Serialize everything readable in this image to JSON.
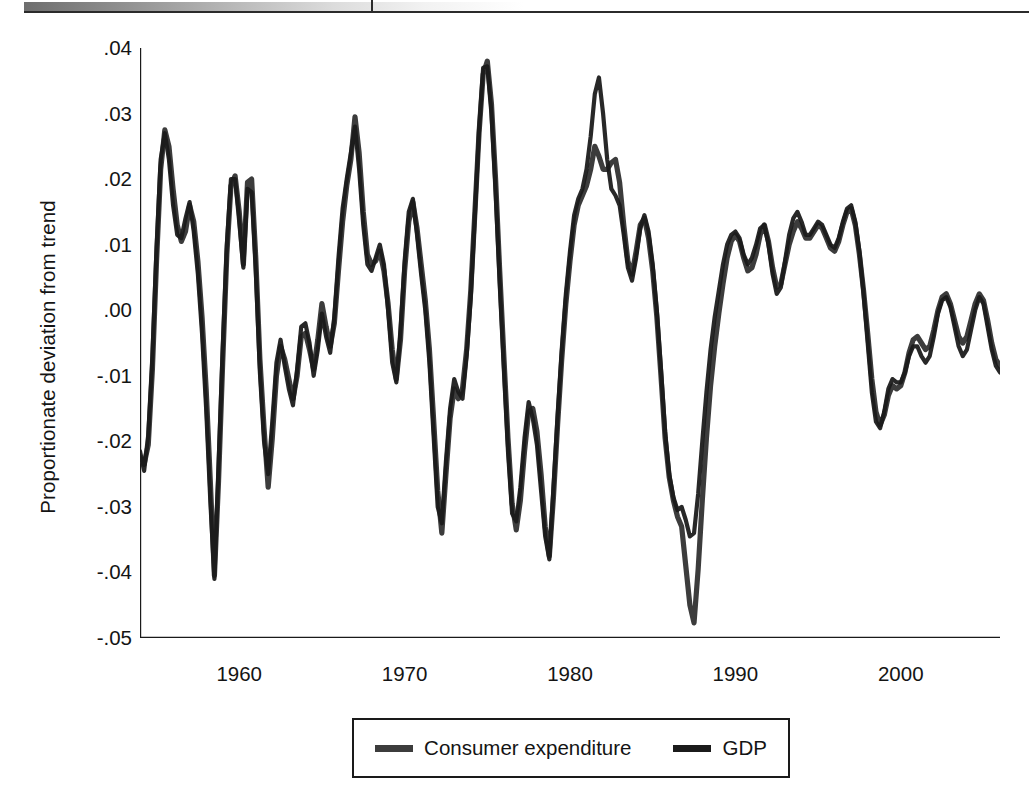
{
  "figure": {
    "title": "",
    "y_axis_title": "Proportionate deviation from trend"
  },
  "legend": {
    "items": [
      {
        "label": "Consumer expenditure",
        "color": "#3c3c3c",
        "swatch": "legend-swatch-consumer-expenditure"
      },
      {
        "label": "GDP",
        "color": "#1b1b1b",
        "swatch": "legend-swatch-gdp"
      }
    ]
  },
  "chart_data": {
    "type": "line",
    "title": "",
    "xlabel": "",
    "ylabel": "Proportionate deviation from trend",
    "xlim": [
      1954.0,
      2006.0
    ],
    "ylim": [
      -0.05,
      0.04
    ],
    "grid": false,
    "legend_position": "bottom-center",
    "y_ticks": [
      0.04,
      0.03,
      0.02,
      0.01,
      0.0,
      -0.01,
      -0.02,
      -0.03,
      -0.04,
      -0.05
    ],
    "y_tick_labels": [
      ".04",
      ".03",
      ".02",
      ".01",
      ".00",
      "-.01",
      "-.02",
      "-.03",
      "-.04",
      "-.05"
    ],
    "x_ticks": [
      1960,
      1970,
      1980,
      1990,
      2000
    ],
    "x_tick_labels": [
      "1960",
      "1970",
      "1980",
      "1990",
      "2000"
    ],
    "x_start": 1954.0,
    "x_step": 0.25,
    "series": [
      {
        "name": "Consumer expenditure",
        "color": "#3c3c3c",
        "values": [
          -0.0225,
          -0.0235,
          -0.0205,
          -0.009,
          0.0075,
          0.0215,
          0.0275,
          0.025,
          0.0185,
          0.013,
          0.0105,
          0.012,
          0.016,
          0.0135,
          0.0075,
          -0.001,
          -0.012,
          -0.026,
          -0.0405,
          -0.026,
          -0.008,
          0.0085,
          0.019,
          0.0205,
          0.015,
          0.007,
          0.0195,
          0.02,
          0.008,
          -0.0075,
          -0.018,
          -0.027,
          -0.0195,
          -0.01,
          -0.0055,
          -0.0075,
          -0.0105,
          -0.0135,
          -0.01,
          -0.004,
          -0.0035,
          -0.006,
          -0.009,
          -0.0045,
          0.001,
          -0.0025,
          -0.0055,
          -0.002,
          0.006,
          0.0135,
          0.019,
          0.023,
          0.0295,
          0.024,
          0.015,
          0.0085,
          0.007,
          0.0075,
          0.009,
          0.006,
          0.001,
          -0.006,
          -0.0105,
          -0.0045,
          0.006,
          0.0135,
          0.0165,
          0.0125,
          0.007,
          0.0015,
          -0.006,
          -0.0165,
          -0.0275,
          -0.034,
          -0.025,
          -0.0165,
          -0.012,
          -0.0135,
          -0.012,
          -0.006,
          0.003,
          0.015,
          0.027,
          0.036,
          0.038,
          0.0315,
          0.02,
          0.006,
          -0.007,
          -0.0195,
          -0.0295,
          -0.0335,
          -0.029,
          -0.0215,
          -0.0155,
          -0.015,
          -0.0185,
          -0.025,
          -0.033,
          -0.0375,
          -0.0285,
          -0.0175,
          -0.0075,
          0.001,
          0.0075,
          0.013,
          0.016,
          0.0175,
          0.019,
          0.0215,
          0.025,
          0.0235,
          0.0215,
          0.0215,
          0.0225,
          0.023,
          0.0195,
          0.013,
          0.0075,
          0.0055,
          0.009,
          0.013,
          0.014,
          0.011,
          0.006,
          -0.001,
          -0.01,
          -0.0195,
          -0.0255,
          -0.029,
          -0.0315,
          -0.033,
          -0.039,
          -0.045,
          -0.0477,
          -0.0395,
          -0.029,
          -0.0195,
          -0.0115,
          -0.0055,
          -0.0005,
          0.004,
          0.008,
          0.0105,
          0.0115,
          0.0105,
          0.008,
          0.006,
          0.0065,
          0.0085,
          0.0115,
          0.013,
          0.0105,
          0.0065,
          0.0035,
          0.004,
          0.007,
          0.01,
          0.012,
          0.0135,
          0.0125,
          0.011,
          0.011,
          0.012,
          0.013,
          0.0125,
          0.011,
          0.0095,
          0.009,
          0.0105,
          0.013,
          0.015,
          0.0155,
          0.013,
          0.0085,
          0.003,
          -0.0035,
          -0.0105,
          -0.0155,
          -0.0175,
          -0.016,
          -0.013,
          -0.0115,
          -0.012,
          -0.0115,
          -0.0095,
          -0.0065,
          -0.0045,
          -0.004,
          -0.005,
          -0.006,
          -0.0055,
          -0.003,
          0.0,
          0.002,
          0.0025,
          0.001,
          -0.0015,
          -0.004,
          -0.005,
          -0.004,
          -0.0015,
          0.001,
          0.0025,
          0.0015,
          -0.0015,
          -0.005,
          -0.0075,
          -0.0085,
          -0.0075,
          -0.0045,
          0.0,
          0.0045,
          0.007,
          0.0075,
          0.007,
          0.0075,
          0.01,
          0.0135,
          0.0165,
          0.0185,
          0.021,
          0.0235,
          0.0245,
          0.02,
          0.014,
          0.008,
          0.003,
          -0.0005,
          -0.003,
          -0.0055,
          -0.008,
          -0.0105,
          -0.013,
          -0.015,
          -0.0145,
          -0.0115,
          -0.0075,
          -0.0035,
          0.0,
          0.002,
          0.003,
          0.0035,
          0.004,
          0.0035,
          0.0025,
          0.002,
          0.003,
          0.0045,
          0.0055,
          0.006,
          0.007,
          0.0075,
          0.0065,
          0.006,
          0.007
        ]
      },
      {
        "name": "GDP",
        "color": "#1b1b1b",
        "values": [
          -0.0215,
          -0.0245,
          -0.019,
          -0.007,
          0.0095,
          0.023,
          0.027,
          0.023,
          0.016,
          0.0115,
          0.011,
          0.014,
          0.0165,
          0.012,
          0.0055,
          -0.0035,
          -0.015,
          -0.029,
          -0.041,
          -0.0235,
          -0.006,
          0.01,
          0.02,
          0.02,
          0.0135,
          0.0065,
          0.0185,
          0.018,
          0.006,
          -0.0095,
          -0.02,
          -0.025,
          -0.017,
          -0.008,
          -0.0045,
          -0.0085,
          -0.012,
          -0.0145,
          -0.009,
          -0.0025,
          -0.002,
          -0.005,
          -0.01,
          -0.006,
          -0.0005,
          -0.004,
          -0.0065,
          -0.001,
          0.008,
          0.0155,
          0.02,
          0.024,
          0.028,
          0.0215,
          0.013,
          0.007,
          0.006,
          0.008,
          0.01,
          0.007,
          0.0,
          -0.008,
          -0.011,
          -0.003,
          0.0075,
          0.015,
          0.017,
          0.0115,
          0.0055,
          0.0,
          -0.008,
          -0.019,
          -0.03,
          -0.0325,
          -0.023,
          -0.015,
          -0.0105,
          -0.0125,
          -0.0135,
          -0.007,
          0.002,
          0.0145,
          0.0275,
          0.037,
          0.0372,
          0.03,
          0.018,
          0.004,
          -0.009,
          -0.0215,
          -0.031,
          -0.0322,
          -0.027,
          -0.0195,
          -0.014,
          -0.0165,
          -0.0205,
          -0.0275,
          -0.0345,
          -0.038,
          -0.027,
          -0.016,
          -0.006,
          0.0025,
          0.009,
          0.0145,
          0.017,
          0.0185,
          0.0215,
          0.0265,
          0.033,
          0.0355,
          0.03,
          0.023,
          0.0185,
          0.0175,
          0.016,
          0.0115,
          0.0065,
          0.0045,
          0.008,
          0.0125,
          0.0145,
          0.012,
          0.007,
          0.0,
          -0.009,
          -0.0185,
          -0.025,
          -0.0285,
          -0.0305,
          -0.03,
          -0.032,
          -0.0345,
          -0.034,
          -0.028,
          -0.02,
          -0.0125,
          -0.006,
          -0.001,
          0.003,
          0.007,
          0.01,
          0.0115,
          0.012,
          0.011,
          0.0085,
          0.007,
          0.008,
          0.01,
          0.0125,
          0.013,
          0.01,
          0.0055,
          0.0025,
          0.0035,
          0.0075,
          0.0115,
          0.014,
          0.015,
          0.0135,
          0.0115,
          0.0115,
          0.0125,
          0.0135,
          0.013,
          0.0115,
          0.01,
          0.0095,
          0.011,
          0.0135,
          0.0155,
          0.016,
          0.0135,
          0.009,
          0.0025,
          -0.005,
          -0.0125,
          -0.017,
          -0.018,
          -0.0155,
          -0.012,
          -0.0105,
          -0.011,
          -0.011,
          -0.0095,
          -0.007,
          -0.0055,
          -0.0055,
          -0.007,
          -0.008,
          -0.007,
          -0.004,
          -0.0005,
          0.0015,
          0.002,
          0.0005,
          -0.0025,
          -0.0055,
          -0.007,
          -0.006,
          -0.003,
          0.0,
          0.002,
          0.001,
          -0.0025,
          -0.006,
          -0.0085,
          -0.0095,
          -0.008,
          -0.0045,
          0.0005,
          0.005,
          0.0075,
          0.008,
          0.0075,
          0.008,
          0.0105,
          0.014,
          0.017,
          0.019,
          0.0205,
          0.022,
          0.0225,
          0.0175,
          0.0115,
          0.0055,
          0.0005,
          -0.003,
          -0.0055,
          -0.0075,
          -0.009,
          -0.0105,
          -0.012,
          -0.013,
          -0.012,
          -0.0095,
          -0.006,
          -0.0025,
          0.0005,
          0.0025,
          0.0035,
          0.004,
          0.0045,
          0.004,
          0.003,
          0.0025,
          0.0035,
          0.005,
          0.006,
          0.006,
          0.0065,
          0.007,
          0.006,
          0.0055,
          0.0065
        ]
      }
    ]
  }
}
